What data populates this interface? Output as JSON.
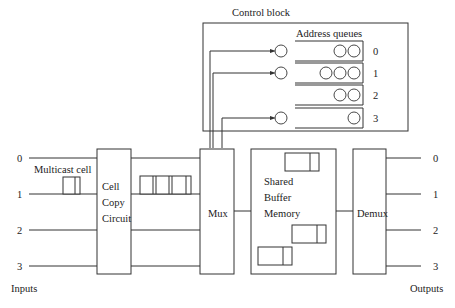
{
  "diagram": {
    "control_block": {
      "title": "Control block",
      "queues_title": "Address queues",
      "queues": [
        {
          "label": "0",
          "entries": 2
        },
        {
          "label": "1",
          "entries": 3
        },
        {
          "label": "2",
          "entries": 2
        },
        {
          "label": "3",
          "entries": 1
        }
      ]
    },
    "inputs": {
      "title": "Inputs",
      "ports": [
        "0",
        "1",
        "2",
        "3"
      ]
    },
    "outputs": {
      "title": "Outputs",
      "ports": [
        "0",
        "1",
        "2",
        "3"
      ]
    },
    "multicast_label": "Multicast cell",
    "cell_copy": [
      "Cell",
      "Copy",
      "Circuit"
    ],
    "mux_label": "Mux",
    "buffer": [
      "Shared",
      "Buffer",
      "Memory"
    ],
    "demux_label": "Demux"
  }
}
